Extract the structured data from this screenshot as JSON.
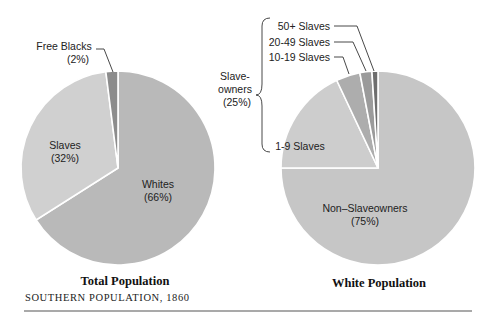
{
  "chart_data": [
    {
      "type": "pie",
      "title": "Total Population",
      "slices": [
        {
          "label": "Whites",
          "pct_label": "(66%)",
          "value": 66,
          "color": "#b9b9b9"
        },
        {
          "label": "Slaves",
          "pct_label": "(32%)",
          "value": 32,
          "color": "#d0d0d0"
        },
        {
          "label": "Free Blacks",
          "pct_label": "(2%)",
          "value": 2,
          "color": "#8c8c8c"
        }
      ]
    },
    {
      "type": "pie",
      "title": "White Population",
      "slices": [
        {
          "label": "Non–Slaveowners",
          "pct_label": "(75%)",
          "value": 75,
          "color": "#c6c6c6"
        },
        {
          "label": "1-9 Slaves",
          "pct_label": "",
          "value": 18,
          "color": "#cdcdcd"
        },
        {
          "label": "10-19 Slaves",
          "pct_label": "",
          "value": 4,
          "color": "#adadad"
        },
        {
          "label": "20-49 Slaves",
          "pct_label": "",
          "value": 2,
          "color": "#9b9b9b"
        },
        {
          "label": "50+ Slaves",
          "pct_label": "",
          "value": 1,
          "color": "#6e6e6e"
        }
      ],
      "group_annotation": {
        "label_line1": "Slave-",
        "label_line2": "owners",
        "label_line3": "(25%)",
        "value": 25
      }
    }
  ],
  "caption": "SOUTHERN POPULATION, 1860"
}
